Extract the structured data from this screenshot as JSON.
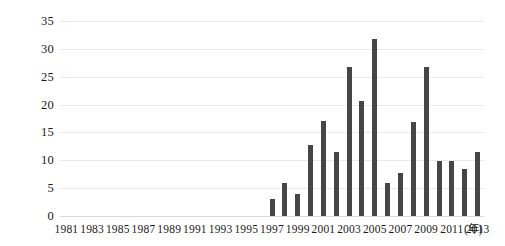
{
  "chart_data": {
    "type": "bar",
    "title": "",
    "subtitle": "",
    "xlabel": "(年)",
    "ylabel": "",
    "categories": [
      "1981",
      "1982",
      "1983",
      "1984",
      "1985",
      "1986",
      "1987",
      "1988",
      "1989",
      "1990",
      "1991",
      "1992",
      "1993",
      "1994",
      "1995",
      "1996",
      "1997",
      "1998",
      "1999",
      "2000",
      "2001",
      "2002",
      "2003",
      "2004",
      "2005",
      "2006",
      "2007",
      "2008",
      "2009",
      "2010",
      "2011",
      "2012",
      "2013"
    ],
    "x_tick_labels": [
      "1981",
      "1983",
      "1985",
      "1987",
      "1989",
      "1991",
      "1993",
      "1995",
      "1997",
      "1999",
      "2001",
      "2003",
      "2005",
      "2007",
      "2009",
      "2011",
      "2013"
    ],
    "x_unit_label": "(年)",
    "values": [
      0,
      0,
      0,
      0,
      0,
      0,
      0,
      0,
      0,
      0,
      0,
      0,
      0,
      0,
      0,
      0,
      3,
      6,
      4,
      12.7,
      17,
      11.5,
      26.8,
      20.7,
      31.7,
      6,
      7.8,
      16.8,
      26.8,
      9.8,
      9.8,
      8.5,
      11.5
    ],
    "bars": [
      {
        "year": "1997",
        "value": 3
      },
      {
        "year": "1998",
        "value": 6
      },
      {
        "year": "1999",
        "value": 4
      },
      {
        "year": "2000",
        "value": 12.7
      },
      {
        "year": "2001",
        "value": 17
      },
      {
        "year": "2002",
        "value": 11.5
      },
      {
        "year": "2003",
        "value": 26.8
      },
      {
        "year": "2004",
        "value": 20.7
      },
      {
        "year": "2005",
        "value": 31.7
      },
      {
        "year": "2006",
        "value": 6
      },
      {
        "year": "2007",
        "value": 7.8
      },
      {
        "year": "2008",
        "value": 16.8
      },
      {
        "year": "2009",
        "value": 26.8
      },
      {
        "year": "2010",
        "value": 9.8
      },
      {
        "year": "2011",
        "value": 9.8
      },
      {
        "year": "2012",
        "value": 8.5
      },
      {
        "year": "2013",
        "value": 11.5
      }
    ],
    "y_tick_labels": [
      "0",
      "5",
      "10",
      "15",
      "20",
      "25",
      "30",
      "35"
    ],
    "y_ticks": [
      0,
      5,
      10,
      15,
      20,
      25,
      30,
      35
    ],
    "ylim": [
      0,
      35
    ],
    "xlim_years": [
      1981,
      2013
    ],
    "grid": true,
    "legend": "none",
    "legend_position": "none",
    "annotations": [],
    "colors": {
      "bar": "#464646",
      "gridline": "#e9e9e9",
      "baseline": "#d9d9d9",
      "text": "#1a1a1a",
      "background": "#ffffff"
    }
  }
}
